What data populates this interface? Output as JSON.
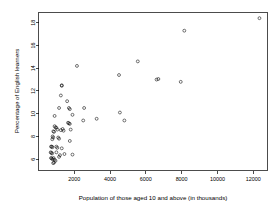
{
  "chart_data": {
    "type": "scatter",
    "title": "",
    "subtitle": "",
    "xlabel": "Population of those aged 10 and above (in thousands)",
    "ylabel": "Percentage of English learners",
    "xlim": [
      0,
      12800
    ],
    "ylim": [
      5.0,
      18.9
    ],
    "xticks": [
      2000,
      4000,
      6000,
      8000,
      10000,
      12000
    ],
    "yticks": [
      6,
      8,
      10,
      12,
      14,
      16,
      18
    ],
    "xtick_labels": [
      "2000",
      "4000",
      "6000",
      "8000",
      "10000",
      "12000"
    ],
    "ytick_labels": [
      "6",
      "8",
      "10",
      "12",
      "14",
      "16",
      "18"
    ],
    "grid": false,
    "legend": null,
    "marker": "open-circle",
    "marker_color": "#000000",
    "points": [
      {
        "x": 12350,
        "y": 18.4
      },
      {
        "x": 8150,
        "y": 17.3
      },
      {
        "x": 5550,
        "y": 14.6
      },
      {
        "x": 2150,
        "y": 14.2
      },
      {
        "x": 4500,
        "y": 13.4
      },
      {
        "x": 6600,
        "y": 13.0
      },
      {
        "x": 6700,
        "y": 13.05
      },
      {
        "x": 7950,
        "y": 12.8
      },
      {
        "x": 1300,
        "y": 12.5
      },
      {
        "x": 1300,
        "y": 12.45
      },
      {
        "x": 1250,
        "y": 11.6
      },
      {
        "x": 1600,
        "y": 11.1
      },
      {
        "x": 1150,
        "y": 10.5
      },
      {
        "x": 1700,
        "y": 10.5
      },
      {
        "x": 1750,
        "y": 10.4
      },
      {
        "x": 2550,
        "y": 10.5
      },
      {
        "x": 4550,
        "y": 10.1
      },
      {
        "x": 900,
        "y": 9.8
      },
      {
        "x": 1900,
        "y": 9.9
      },
      {
        "x": 2500,
        "y": 9.4
      },
      {
        "x": 3250,
        "y": 9.55
      },
      {
        "x": 4800,
        "y": 9.4
      },
      {
        "x": 1650,
        "y": 9.2
      },
      {
        "x": 1700,
        "y": 9.15
      },
      {
        "x": 1750,
        "y": 9.1
      },
      {
        "x": 900,
        "y": 8.9
      },
      {
        "x": 950,
        "y": 8.8
      },
      {
        "x": 1000,
        "y": 8.75
      },
      {
        "x": 1050,
        "y": 8.6
      },
      {
        "x": 1350,
        "y": 8.65
      },
      {
        "x": 1800,
        "y": 8.6
      },
      {
        "x": 830,
        "y": 8.45
      },
      {
        "x": 870,
        "y": 8.4
      },
      {
        "x": 1250,
        "y": 8.55
      },
      {
        "x": 1400,
        "y": 8.5
      },
      {
        "x": 790,
        "y": 8.0
      },
      {
        "x": 820,
        "y": 7.9
      },
      {
        "x": 770,
        "y": 7.75
      },
      {
        "x": 1100,
        "y": 7.9
      },
      {
        "x": 1150,
        "y": 7.8
      },
      {
        "x": 1750,
        "y": 7.6
      },
      {
        "x": 700,
        "y": 7.1
      },
      {
        "x": 740,
        "y": 7.1
      },
      {
        "x": 780,
        "y": 7.05
      },
      {
        "x": 1000,
        "y": 7.1
      },
      {
        "x": 1050,
        "y": 7.0
      },
      {
        "x": 1300,
        "y": 6.95
      },
      {
        "x": 680,
        "y": 6.6
      },
      {
        "x": 720,
        "y": 6.55
      },
      {
        "x": 760,
        "y": 6.5
      },
      {
        "x": 1000,
        "y": 6.6
      },
      {
        "x": 1450,
        "y": 6.45
      },
      {
        "x": 1900,
        "y": 6.4
      },
      {
        "x": 700,
        "y": 6.1
      },
      {
        "x": 740,
        "y": 6.05
      },
      {
        "x": 790,
        "y": 6.0
      },
      {
        "x": 840,
        "y": 6.1
      },
      {
        "x": 900,
        "y": 5.95
      },
      {
        "x": 950,
        "y": 5.85
      },
      {
        "x": 870,
        "y": 5.7
      },
      {
        "x": 820,
        "y": 5.65
      },
      {
        "x": 1200,
        "y": 6.35
      },
      {
        "x": 1150,
        "y": 6.2
      }
    ]
  },
  "axes": {
    "x_axis_name": "x-axis",
    "y_axis_name": "y-axis"
  }
}
